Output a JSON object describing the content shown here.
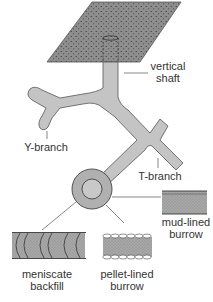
{
  "diagram": {
    "labels": {
      "vertical_shaft_1": "vertical",
      "vertical_shaft_2": "shaft",
      "y_branch": "Y-branch",
      "t_branch": "T-branch",
      "mud_lined_1": "mud-lined",
      "mud_lined_2": "burrow",
      "meniscate_1": "meniscate",
      "meniscate_2": "backfill",
      "pellet_lined_1": "pellet-lined",
      "pellet_lined_2": "burrow"
    },
    "colors": {
      "surface_fill": "#8c8c8c",
      "burrow_fill": "#c4c4c4",
      "outline": "#555555",
      "text": "#333333",
      "lining_fill": "#9a9a9a"
    }
  }
}
